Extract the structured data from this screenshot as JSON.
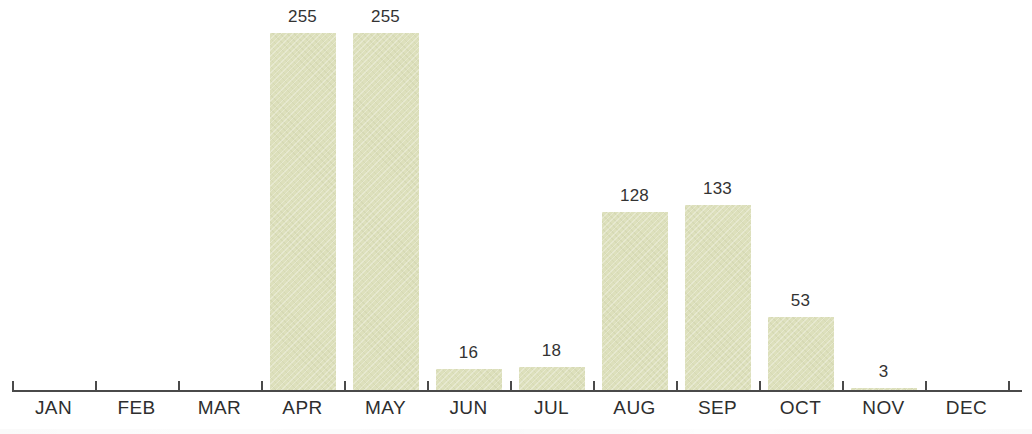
{
  "chart_data": {
    "type": "bar",
    "title": "",
    "subtitle": "",
    "xlabel": "",
    "ylabel": "",
    "categories": [
      "JAN",
      "FEB",
      "MAR",
      "APR",
      "MAY",
      "JUN",
      "JUL",
      "AUG",
      "SEP",
      "OCT",
      "NOV",
      "DEC"
    ],
    "values": [
      0,
      0,
      0,
      255,
      255,
      16,
      18,
      128,
      133,
      53,
      3,
      0
    ],
    "value_labels": [
      "",
      "",
      "",
      "255",
      "255",
      "16",
      "18",
      "128",
      "133",
      "53",
      "3",
      ""
    ],
    "ylim": [
      0,
      255
    ],
    "grid": false,
    "legend": null,
    "bar_color": "#dde0bc",
    "label_color": "#333333",
    "axis_color": "#4a4a4a",
    "background_color": "#ffffff"
  },
  "axis": {
    "tick_count": 13
  }
}
